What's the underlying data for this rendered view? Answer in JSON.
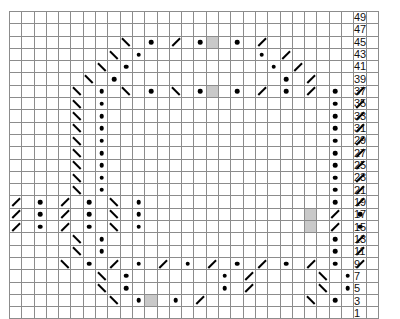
{
  "chart_data": {
    "type": "table",
    "title": "",
    "xlabel": "",
    "ylabel": "",
    "columns": 30,
    "rows": 25,
    "legend": [
      {
        "symbol": "dot",
        "label": "purl stitch"
      },
      {
        "symbol": "slash-right",
        "label": "right-leaning decrease"
      },
      {
        "symbol": "slash-left",
        "label": "left-leaning decrease"
      },
      {
        "symbol": "shaded-cell",
        "label": "no stitch / highlighted stitch"
      }
    ],
    "colors": {
      "grid_line": "#8c8c8c",
      "frame": "#555555",
      "symbol": "#000000",
      "shaded_cell": "#c9c9c9",
      "background": "#ffffff"
    },
    "row_labels": [
      "49",
      "47",
      "45",
      "43",
      "41",
      "39",
      "37",
      "35",
      "33",
      "31",
      "29",
      "27",
      "25",
      "23",
      "21",
      "19",
      "17",
      "15",
      "13",
      "11",
      "9",
      "7",
      "5",
      "3",
      "1"
    ],
    "row_label_position": "right",
    "cells": [
      [
        "",
        "",
        "",
        "",
        "",
        "",
        "",
        "",
        "",
        "",
        "",
        "",
        "",
        "",
        "",
        "",
        "",
        "",
        "",
        "",
        "",
        "",
        "",
        "",
        "",
        "",
        "",
        "",
        "",
        ""
      ],
      [
        "",
        "",
        "",
        "",
        "",
        "",
        "",
        "",
        "",
        "",
        "",
        "",
        "",
        "",
        "",
        "",
        "",
        "",
        "",
        "",
        "",
        "",
        "",
        "",
        "",
        "",
        "",
        "",
        "",
        ""
      ],
      [
        "",
        "",
        "",
        "",
        "",
        "",
        "",
        "",
        "",
        "bs",
        "",
        "dot",
        "",
        "sl",
        "",
        "dot",
        "shade",
        "",
        "dot",
        "",
        "sl",
        "",
        "",
        "",
        "",
        "",
        "",
        "",
        "",
        ""
      ],
      [
        "",
        "",
        "",
        "",
        "",
        "",
        "",
        "",
        "bs",
        "",
        "dot",
        "",
        "",
        "",
        "",
        "",
        "",
        "",
        "",
        "",
        "dot",
        "",
        "sl",
        "",
        "",
        "",
        "",
        "",
        "",
        ""
      ],
      [
        "",
        "",
        "",
        "",
        "",
        "",
        "",
        "bs",
        "",
        "dot",
        "",
        "",
        "",
        "",
        "",
        "",
        "",
        "",
        "",
        "",
        "",
        "dot",
        "",
        "sl",
        "",
        "",
        "",
        "",
        "",
        ""
      ],
      [
        "",
        "",
        "",
        "",
        "",
        "",
        "bs",
        "",
        "dot",
        "",
        "",
        "",
        "",
        "",
        "",
        "",
        "",
        "",
        "",
        "",
        "",
        "",
        "dot",
        "",
        "sl",
        "",
        "",
        "",
        "",
        ""
      ],
      [
        "",
        "",
        "",
        "",
        "",
        "bs",
        "",
        "dot",
        "",
        "bs",
        "",
        "dot",
        "",
        "bs",
        "",
        "dot",
        "shade",
        "",
        "dot",
        "",
        "sl",
        "",
        "dot",
        "",
        "sl",
        "",
        "dot",
        "",
        "sl",
        ""
      ],
      [
        "",
        "",
        "",
        "",
        "",
        "bs",
        "",
        "dot",
        "",
        "",
        "",
        "",
        "",
        "",
        "",
        "",
        "",
        "",
        "",
        "",
        "",
        "",
        "",
        "",
        "",
        "",
        "dot",
        "",
        "sl",
        ""
      ],
      [
        "",
        "",
        "",
        "",
        "",
        "bs",
        "",
        "dot",
        "",
        "",
        "",
        "",
        "",
        "",
        "",
        "",
        "",
        "",
        "",
        "",
        "",
        "",
        "",
        "",
        "",
        "",
        "dot",
        "",
        "sl",
        ""
      ],
      [
        "",
        "",
        "",
        "",
        "",
        "bs",
        "",
        "dot",
        "",
        "",
        "",
        "",
        "",
        "",
        "",
        "",
        "",
        "",
        "",
        "",
        "",
        "",
        "",
        "",
        "",
        "",
        "dot",
        "",
        "sl",
        ""
      ],
      [
        "",
        "",
        "",
        "",
        "",
        "bs",
        "",
        "dot",
        "",
        "",
        "",
        "",
        "",
        "",
        "",
        "",
        "",
        "",
        "",
        "",
        "",
        "",
        "",
        "",
        "",
        "",
        "dot",
        "",
        "sl",
        ""
      ],
      [
        "",
        "",
        "",
        "",
        "",
        "bs",
        "",
        "dot",
        "",
        "",
        "",
        "",
        "",
        "",
        "",
        "",
        "",
        "",
        "",
        "",
        "",
        "",
        "",
        "",
        "",
        "",
        "dot",
        "",
        "sl",
        ""
      ],
      [
        "",
        "",
        "",
        "",
        "",
        "bs",
        "",
        "dot",
        "",
        "",
        "",
        "",
        "",
        "",
        "",
        "",
        "",
        "",
        "",
        "",
        "",
        "",
        "",
        "",
        "",
        "",
        "dot",
        "",
        "sl",
        ""
      ],
      [
        "",
        "",
        "",
        "",
        "",
        "bs",
        "",
        "dot",
        "",
        "",
        "",
        "",
        "",
        "",
        "",
        "",
        "",
        "",
        "",
        "",
        "",
        "",
        "",
        "",
        "",
        "",
        "dot",
        "",
        "sl",
        ""
      ],
      [
        "",
        "",
        "",
        "",
        "",
        "bs",
        "",
        "dot",
        "",
        "",
        "",
        "",
        "",
        "",
        "",
        "",
        "",
        "",
        "",
        "",
        "",
        "",
        "",
        "",
        "",
        "",
        "dot",
        "",
        "sl",
        ""
      ],
      [
        "sl",
        "",
        "dot",
        "",
        "sl",
        "",
        "dot",
        "",
        "bs",
        "",
        "dot",
        "",
        "",
        "",
        "",
        "",
        "",
        "",
        "",
        "",
        "",
        "",
        "",
        "",
        "",
        "",
        "dot",
        "",
        "sl",
        ""
      ],
      [
        "sl",
        "",
        "dot",
        "",
        "sl",
        "",
        "dot",
        "",
        "bs",
        "",
        "dot",
        "",
        "",
        "",
        "",
        "",
        "",
        "",
        "",
        "",
        "",
        "",
        "",
        "",
        "shade",
        "",
        "sl",
        "",
        "dot",
        ""
      ],
      [
        "sl",
        "",
        "dot",
        "",
        "sl",
        "",
        "dot",
        "",
        "bs",
        "",
        "dot",
        "",
        "",
        "",
        "",
        "",
        "",
        "",
        "",
        "",
        "",
        "",
        "",
        "",
        "shade",
        "",
        "sl",
        "",
        "dot",
        ""
      ],
      [
        "",
        "",
        "",
        "",
        "",
        "bs",
        "",
        "dot",
        "",
        "",
        "",
        "",
        "",
        "",
        "",
        "",
        "",
        "",
        "",
        "",
        "",
        "",
        "",
        "",
        "",
        "",
        "dot",
        "",
        "sl",
        ""
      ],
      [
        "",
        "",
        "",
        "",
        "",
        "bs",
        "",
        "dot",
        "",
        "",
        "",
        "",
        "",
        "",
        "",
        "",
        "",
        "",
        "",
        "",
        "",
        "",
        "",
        "",
        "",
        "",
        "dot",
        "",
        "sl",
        ""
      ],
      [
        "",
        "",
        "",
        "",
        "bs",
        "",
        "dot",
        "",
        "sl",
        "",
        "dot",
        "",
        "sl",
        "",
        "dot",
        "",
        "sl",
        "",
        "dot",
        "",
        "sl",
        "",
        "dot",
        "",
        "sl",
        "",
        "dot",
        "",
        "sl",
        ""
      ],
      [
        "",
        "",
        "",
        "",
        "",
        "",
        "",
        "bs",
        "",
        "dot",
        "",
        "",
        "",
        "",
        "",
        "",
        "",
        "dot",
        "",
        "sl",
        "",
        "",
        "",
        "",
        "",
        "bs",
        "",
        "dot",
        "",
        ""
      ],
      [
        "",
        "",
        "",
        "",
        "",
        "",
        "",
        "bs",
        "",
        "dot",
        "",
        "",
        "",
        "",
        "",
        "",
        "",
        "dot",
        "",
        "sl",
        "",
        "",
        "",
        "",
        "",
        "bs",
        "",
        "dot",
        "",
        ""
      ],
      [
        "",
        "",
        "",
        "",
        "",
        "",
        "",
        "",
        "bs",
        "",
        "dot",
        "shade",
        "",
        "dot",
        "",
        "sl",
        "",
        "",
        "",
        "",
        "",
        "",
        "",
        "",
        "bs",
        "",
        "dot",
        "",
        "",
        ""
      ],
      [
        "",
        "",
        "",
        "",
        "",
        "",
        "",
        "",
        "",
        "",
        "",
        "",
        "",
        "",
        "",
        "",
        "",
        "",
        "",
        "",
        "",
        "",
        "",
        "",
        "",
        "",
        "",
        "",
        "",
        ""
      ]
    ]
  }
}
